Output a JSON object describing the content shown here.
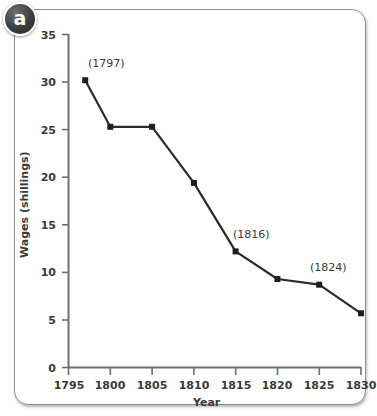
{
  "panel": {
    "label": "a"
  },
  "chart_data": {
    "type": "line",
    "title": "",
    "xlabel": "Year",
    "ylabel": "Wages (shillings)",
    "xlim": [
      1795,
      1830
    ],
    "ylim": [
      0,
      35
    ],
    "grid": false,
    "legend": "none",
    "xticks": [
      "1795",
      "1800",
      "1805",
      "1810",
      "1815",
      "1820",
      "1825",
      "1830"
    ],
    "yticks": [
      "0",
      "5",
      "10",
      "15",
      "20",
      "25",
      "30",
      "35"
    ],
    "x": [
      1797,
      1800,
      1805,
      1810,
      1815,
      1820,
      1825,
      1830
    ],
    "values": [
      30.2,
      25.3,
      25.3,
      19.4,
      12.2,
      9.3,
      8.7,
      5.7
    ],
    "series": [
      {
        "name": "Wages",
        "values": [
          30.2,
          25.3,
          25.3,
          19.4,
          12.2,
          9.3,
          8.7,
          5.7
        ]
      }
    ],
    "annotations": [
      {
        "text": "(1797)",
        "x": 1797,
        "y": 30.2
      },
      {
        "text": "(1816)",
        "x": 1815,
        "y": 12.2
      },
      {
        "text": "(1824)",
        "x": 1825,
        "y": 8.7
      }
    ],
    "colors": {
      "line": "#2b2b2b",
      "marker": "#1f1f1f",
      "axis": "#6d6f71",
      "text": "#3a3a3a"
    }
  }
}
